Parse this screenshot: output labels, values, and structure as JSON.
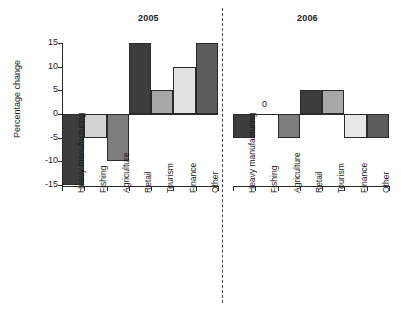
{
  "chart_data": {
    "type": "bar",
    "title": "",
    "ylabel": "Percentage change",
    "xlabel": "",
    "ylim": [
      -15,
      15
    ],
    "yticks": [
      15,
      10,
      5,
      0,
      -5,
      -10,
      -15
    ],
    "grid": false,
    "legend": "none",
    "panels": [
      {
        "name": "2005",
        "label": "2005",
        "categories": [
          "Heavy manufacturing",
          "Fishing",
          "Agriculture",
          "Retail",
          "Tourism",
          "Finance",
          "Other"
        ],
        "values": [
          -15,
          -5,
          -10,
          15,
          5,
          10,
          15
        ],
        "colors": [
          "#3d3d3d",
          "#d2d2d2",
          "#7d7d7d",
          "#3d3d3d",
          "#a8a8a8",
          "#e2e2e2",
          "#5c5c5c"
        ]
      },
      {
        "name": "2006",
        "label": "2006",
        "categories": [
          "Heavy manufacturing",
          "Fishing",
          "Agriculture",
          "Retail",
          "Tourism",
          "Finance",
          "Other"
        ],
        "values": [
          -5,
          0,
          -5,
          5,
          5,
          -5,
          -5
        ],
        "colors": [
          "#3d3d3d",
          "#ffffff",
          "#7d7d7d",
          "#3d3d3d",
          "#a8a8a8",
          "#e8e8e8",
          "#5c5c5c"
        ]
      }
    ],
    "annotations": [
      {
        "text": "0",
        "panel": "2006",
        "category": "Fishing",
        "value": 0
      }
    ]
  }
}
